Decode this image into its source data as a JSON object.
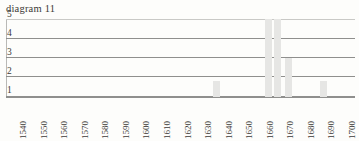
{
  "chart_data": {
    "type": "bar",
    "title": "diagram 11",
    "xlabel": "",
    "ylabel": "",
    "grid": true,
    "legend": null,
    "ylim": [
      0,
      5
    ],
    "y_ticks": [
      5,
      4,
      3,
      2,
      1
    ],
    "categories": [
      "1540",
      "1550",
      "1560",
      "1570",
      "1580",
      "1590",
      "1600",
      "1610",
      "1620",
      "1630",
      "1640",
      "1650",
      "1660",
      "1670",
      "1680",
      "1690",
      "1700"
    ],
    "values": [
      0,
      0,
      0,
      0,
      0,
      0,
      0,
      0,
      0,
      1,
      0,
      0,
      5,
      0,
      0,
      1,
      0
    ],
    "bars": [
      {
        "label": "1630",
        "value": 1,
        "x_frac": 0.592
      },
      {
        "label": "1662",
        "value": 5,
        "x_frac": 0.741
      },
      {
        "label": "1665",
        "value": 5,
        "x_frac": 0.769
      },
      {
        "label": "1668",
        "value": 2.5,
        "x_frac": 0.799
      },
      {
        "label": "1690",
        "value": 1,
        "x_frac": 0.9
      }
    ],
    "bar_color": "#e6e6e4",
    "grid_color": "#8f8f8d",
    "text_color": "#3c3a37"
  }
}
